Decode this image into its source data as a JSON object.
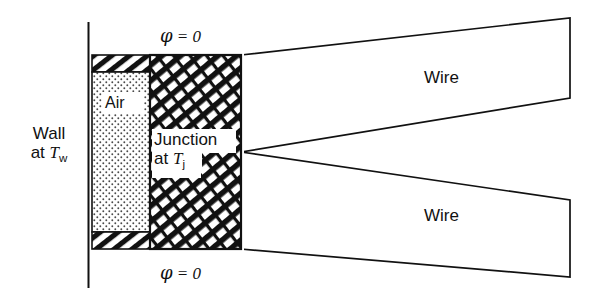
{
  "figure": {
    "background_color": "#ffffff",
    "line_color": "#111111",
    "width": 595,
    "height": 303
  },
  "labels": {
    "wall_line1": "Wall",
    "wall_line2_prefix": "at ",
    "wall_line2_symbol": "T",
    "wall_line2_subscript": "w",
    "air": "Air",
    "junction_line1": "Junction",
    "junction_line2_prefix": "at ",
    "junction_line2_symbol": "T",
    "junction_line2_subscript": "j",
    "phi_symbol": "φ",
    "phi_equals": " = 0",
    "phi_top": "φ = 0",
    "phi_bottom": "φ = 0",
    "wire_top": "Wire",
    "wire_bottom": "Wire"
  },
  "regions": {
    "air_block": {
      "name": "air-gap",
      "fill_pattern": "stipple-dots",
      "x": 92,
      "y": 72,
      "width": 58,
      "height": 160
    },
    "air_top_cap": {
      "name": "air-top-hatch-strip",
      "fill_pattern": "diagonal-hatch-single",
      "x": 92,
      "y": 55,
      "width": 58,
      "height": 17
    },
    "air_bottom_cap": {
      "name": "air-bottom-hatch-strip",
      "fill_pattern": "diagonal-hatch-single",
      "x": 92,
      "y": 232,
      "width": 58,
      "height": 17
    },
    "junction_block": {
      "name": "junction-body",
      "fill_pattern": "diagonal-cross-hatch",
      "x": 150,
      "y": 55,
      "width": 91,
      "height": 194
    },
    "wall_line": {
      "name": "wall-boundary-line",
      "x": 88,
      "y_top": 22,
      "y_bottom": 288
    }
  },
  "wires": {
    "top": {
      "name": "wire-top",
      "points": "241,55 570,18 570,98 241,152"
    },
    "bottom": {
      "name": "wire-bottom",
      "points": "241,152 570,200 570,277 241,249"
    }
  }
}
